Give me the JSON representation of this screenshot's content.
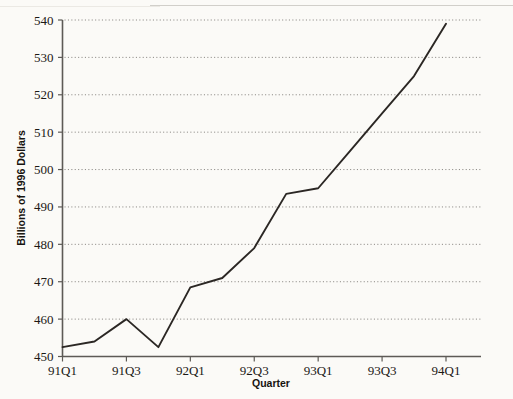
{
  "chart_data": {
    "type": "line",
    "title": "",
    "xlabel": "Quarter",
    "ylabel": "Billions of 1996 Dollars",
    "ylim": [
      450,
      540
    ],
    "ytick_labels": [
      "450",
      "460",
      "470",
      "480",
      "490",
      "500",
      "510",
      "520",
      "530",
      "540"
    ],
    "ytick_values": [
      450,
      460,
      470,
      480,
      490,
      500,
      510,
      520,
      530,
      540
    ],
    "xtick_labels": [
      "91Q1",
      "91Q3",
      "92Q1",
      "92Q3",
      "93Q1",
      "93Q3",
      "94Q1"
    ],
    "grid": "horizontal-dotted",
    "legend": "none",
    "categories": [
      "91Q1",
      "91Q2",
      "91Q3",
      "91Q4",
      "92Q1",
      "92Q2",
      "92Q3",
      "92Q4",
      "93Q1",
      "93Q2",
      "93Q3",
      "93Q4",
      "94Q1"
    ],
    "values": [
      452.5,
      454.0,
      460.0,
      452.5,
      468.5,
      471.0,
      479.0,
      493.5,
      495.0,
      505.0,
      515.0,
      525.0,
      539.0
    ],
    "series": [
      {
        "name": "Real GDP",
        "color": "#2b2724",
        "values": [
          452.5,
          454.0,
          460.0,
          452.5,
          468.5,
          471.0,
          479.0,
          493.5,
          495.0,
          505.0,
          515.0,
          525.0,
          539.0
        ]
      }
    ]
  },
  "axis": {
    "y_title": "Billions of 1996 Dollars",
    "x_title": "Quarter"
  },
  "colors": {
    "page_background": "#fbfaf7",
    "line": "#2b2724",
    "axis": "#5d5a56",
    "gridline": "#8d8a86",
    "text": "#1b1815"
  }
}
